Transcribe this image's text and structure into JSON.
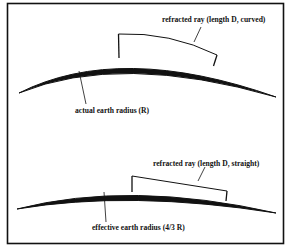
{
  "figure": {
    "frame": {
      "stroke": "#111111"
    },
    "panel_top": {
      "ray_label": "refracted ray (length D, curved)",
      "earth_label": "actual earth radius (R)"
    },
    "panel_bottom": {
      "ray_label": "refracted ray (length D, straight)",
      "earth_label": "effective earth radius (4/3 R)"
    }
  }
}
